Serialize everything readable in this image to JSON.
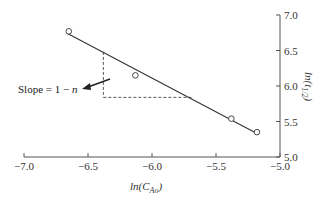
{
  "chart_data": {
    "type": "scatter",
    "title": "",
    "xlabel": "ln(C_Ao)",
    "ylabel": "ln(t_1/2)",
    "xlim": [
      -7.0,
      -5.0
    ],
    "ylim": [
      5.0,
      7.0
    ],
    "x_ticks": [
      "-7.0",
      "-6.5",
      "-6.0",
      "-5.5",
      "-5.0"
    ],
    "y_ticks": [
      "5.0",
      "5.5",
      "6.0",
      "6.5",
      "7.0"
    ],
    "grid": false,
    "legend": null,
    "y_axis_position": "right",
    "series": [
      {
        "name": "data",
        "marker": "open-circle",
        "x": [
          -6.65,
          -6.13,
          -5.38,
          -5.18
        ],
        "y": [
          6.77,
          6.15,
          5.54,
          5.35
        ]
      },
      {
        "name": "fit line",
        "style": "solid",
        "x": [
          -6.66,
          -5.18
        ],
        "y": [
          6.74,
          5.33
        ]
      }
    ],
    "annotations": [
      {
        "text": "Slope = 1 − n",
        "type": "arrow-label"
      },
      {
        "type": "dashed-slope-triangle",
        "x": [
          -6.38,
          -5.69
        ],
        "y": [
          5.84,
          6.48
        ]
      }
    ]
  },
  "labels": {
    "xlabel_prefix": "ln(C",
    "xlabel_sub": "Ao",
    "xlabel_suffix": ")",
    "ylabel_prefix": "ln(t",
    "ylabel_sub": "1/2",
    "ylabel_suffix": ")",
    "slope_text": "Slope = 1 − ",
    "slope_var": "n"
  }
}
